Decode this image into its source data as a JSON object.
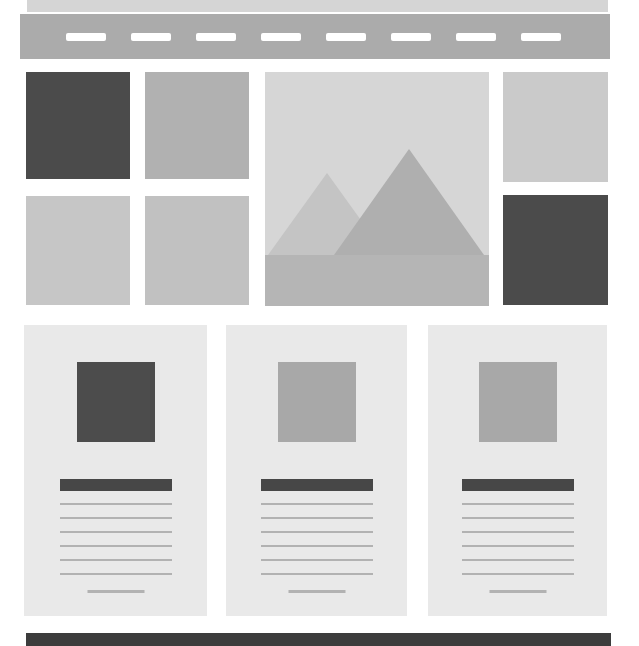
{
  "page": {
    "width": 639,
    "height": 646,
    "background": "#ffffff"
  },
  "colors": {
    "top_bar": "#d5d5d5",
    "nav_bar": "#ababab",
    "nav_dash": "#ffffff",
    "text_line": "#b2b2b2",
    "card_bg": "#e9e9e9",
    "title_bar": "#474747",
    "footer": "#3c3c3c",
    "image_bg": "#d6d6d6",
    "mountain_small": "#c4c4c4",
    "mountain_big": "#afafaf",
    "image_ground": "#b5b5b5"
  },
  "nav": {
    "dash_count": 8
  },
  "hero_grid": {
    "tiles": [
      {
        "name": "grid-tile-top-left",
        "color": "#4b4b4b"
      },
      {
        "name": "grid-tile-top-second",
        "color": "#b1b1b1"
      },
      {
        "name": "grid-tile-bottom-left",
        "color": "#c6c6c6"
      },
      {
        "name": "grid-tile-bottom-second",
        "color": "#c1c1c1"
      },
      {
        "name": "grid-tile-top-right",
        "color": "#cacaca"
      },
      {
        "name": "grid-tile-bottom-right",
        "color": "#4b4b4b"
      }
    ]
  },
  "cards": [
    {
      "name": "card-1",
      "thumb_color": "#4c4c4c",
      "line_count": 6
    },
    {
      "name": "card-2",
      "thumb_color": "#a8a8a8",
      "line_count": 6
    },
    {
      "name": "card-3",
      "thumb_color": "#a8a8a8",
      "line_count": 6
    }
  ]
}
